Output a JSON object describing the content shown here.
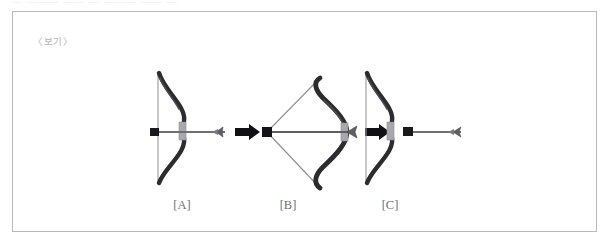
{
  "clipped_top_text": "— ——— ——   —   ———   —— —",
  "figure": {
    "caption": "〈보기〉",
    "border_color": "#b9b9bb",
    "background": "#ffffff"
  },
  "stages": [
    {
      "id": "A",
      "label": "[A]",
      "state_name": "bow-relaxed-arrow-nocked",
      "description": "Bow at rest with straight vertical string; arrow nocked and pointing right",
      "center_x": 169,
      "string_drawn": false,
      "arrow_released": false
    },
    {
      "id": "B",
      "label": "[B]",
      "state_name": "bow-drawn-string-pulled-back",
      "description": "Bow fully drawn; bowstring pulled back into a triangle, arrow held at full draw",
      "center_x": 275,
      "string_drawn": true,
      "arrow_released": false
    },
    {
      "id": "C",
      "label": "[C]",
      "state_name": "bow-released-arrow-in-flight",
      "description": "Bow returned to rest after release; arrow flying away to the right",
      "center_x": 377,
      "string_drawn": false,
      "arrow_released": true
    }
  ],
  "transition_arrows": [
    {
      "name": "transition-a-to-b",
      "from": "A",
      "to": "B"
    },
    {
      "name": "transition-b-to-c",
      "from": "B",
      "to": "C"
    }
  ],
  "colors": {
    "bow_limb": "#2b2b30",
    "bow_grip": "#a8a8ad",
    "string": "#8e8e93",
    "arrow_shaft": "#6e6e73",
    "arrow_nock": "#1a1a1e",
    "transition_arrow": "#111115",
    "label_text": "#6f6f72",
    "caption_text": "#b5b5b8",
    "frame_border": "#b9b9bb"
  }
}
